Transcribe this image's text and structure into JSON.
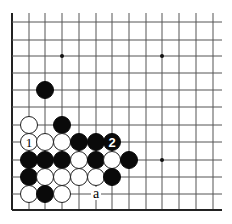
{
  "board": {
    "columns": 13,
    "rows": 12,
    "col_x": [
      12,
      29,
      45,
      62,
      79,
      96,
      112,
      129,
      146,
      162,
      179,
      196,
      213
    ],
    "row_y_from_bottom": [
      210,
      194,
      177,
      160,
      142,
      125,
      107,
      90,
      73,
      56,
      40,
      22
    ],
    "line_extent": {
      "left": 12,
      "right": 222,
      "top": 13,
      "bottom": 210
    },
    "edges": [
      "left",
      "bottom"
    ],
    "stone_radius": 8.5,
    "hoshi": [
      {
        "col": 4,
        "row": 10
      },
      {
        "col": 10,
        "row": 10
      },
      {
        "col": 10,
        "row": 4
      },
      {
        "col": 4,
        "row": 4
      }
    ]
  },
  "stones": [
    {
      "color": "black",
      "col": 3,
      "row": 8
    },
    {
      "color": "white",
      "col": 2,
      "row": 6
    },
    {
      "color": "black",
      "col": 4,
      "row": 6
    },
    {
      "color": "white",
      "col": 2,
      "row": 5,
      "label": "1"
    },
    {
      "color": "white",
      "col": 3,
      "row": 5
    },
    {
      "color": "white",
      "col": 4,
      "row": 5
    },
    {
      "color": "black",
      "col": 5,
      "row": 5
    },
    {
      "color": "black",
      "col": 6,
      "row": 5
    },
    {
      "color": "black",
      "col": 7,
      "row": 5,
      "label": "2"
    },
    {
      "color": "black",
      "col": 2,
      "row": 4
    },
    {
      "color": "black",
      "col": 3,
      "row": 4
    },
    {
      "color": "black",
      "col": 4,
      "row": 4
    },
    {
      "color": "white",
      "col": 5,
      "row": 4
    },
    {
      "color": "black",
      "col": 6,
      "row": 4
    },
    {
      "color": "white",
      "col": 7,
      "row": 4
    },
    {
      "color": "black",
      "col": 8,
      "row": 4
    },
    {
      "color": "black",
      "col": 2,
      "row": 3
    },
    {
      "color": "white",
      "col": 3,
      "row": 3
    },
    {
      "color": "white",
      "col": 4,
      "row": 3
    },
    {
      "color": "white",
      "col": 5,
      "row": 3
    },
    {
      "color": "white",
      "col": 6,
      "row": 3
    },
    {
      "color": "black",
      "col": 7,
      "row": 3
    },
    {
      "color": "white",
      "col": 2,
      "row": 2
    },
    {
      "color": "black",
      "col": 3,
      "row": 2
    },
    {
      "color": "white",
      "col": 4,
      "row": 2
    }
  ],
  "markers": [
    {
      "text": "a",
      "col": 6,
      "row": 2
    }
  ]
}
